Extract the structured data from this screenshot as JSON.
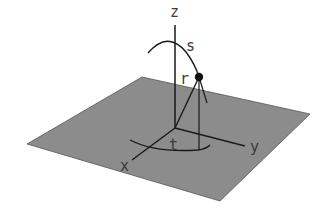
{
  "diagram": {
    "axes": {
      "x_label": "x",
      "y_label": "y",
      "z_label": "z"
    },
    "parameters": {
      "s_label": "s",
      "r_label": "r",
      "t_label": "t"
    },
    "colors": {
      "plane": "#8c8c8c",
      "lines": "#1a1a1a",
      "background": "#ffffff"
    }
  }
}
